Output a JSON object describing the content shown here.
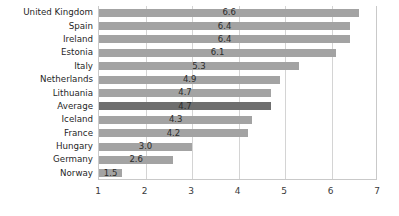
{
  "chart_data": {
    "type": "bar",
    "orientation": "horizontal",
    "title": "",
    "subtitle": "",
    "xlabel": "",
    "ylabel": "",
    "xlim": [
      1,
      7
    ],
    "xticks": [
      1,
      2,
      3,
      4,
      5,
      6,
      7
    ],
    "xtick_labels": [
      "1",
      "2",
      "3",
      "4",
      "5",
      "6",
      "7"
    ],
    "grid": true,
    "grid_axis": "x",
    "legend": false,
    "legend_position": "none",
    "bar_color": "#a3a3a3",
    "highlight_color": "#6e6e6e",
    "highlight_category": "Average",
    "categories": [
      "United Kingdom",
      "Spain",
      "Ireland",
      "Estonia",
      "Italy",
      "Netherlands",
      "Lithuania",
      "Average",
      "Iceland",
      "France",
      "Hungary",
      "Germany",
      "Norway"
    ],
    "values": [
      6.6,
      6.4,
      6.4,
      6.1,
      5.3,
      4.9,
      4.7,
      4.7,
      4.3,
      4.2,
      3.0,
      2.6,
      1.5
    ],
    "data_labels": [
      "6.6",
      "6.4",
      "6.4",
      "6.1",
      "5.3",
      "4.9",
      "4.7",
      "4.7",
      "4.3",
      "4.2",
      "3.0",
      "2.6",
      "1.5"
    ]
  }
}
